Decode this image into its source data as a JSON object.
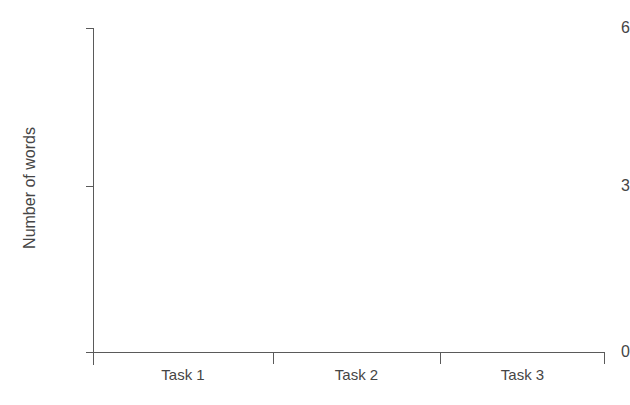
{
  "chart_data": {
    "type": "bar",
    "title": "",
    "subtitle": "",
    "xlabel": "",
    "ylabel": "Number of words",
    "categories": [
      "Task 1",
      "Task 2",
      "Task 3"
    ],
    "values": [
      0,
      0,
      0
    ],
    "series": [],
    "ylim": [
      0,
      6
    ],
    "y_ticks": [
      "0",
      "3",
      "6"
    ],
    "y_tick_values": [
      0,
      3,
      6
    ],
    "grid": false,
    "legend": false,
    "legend_position": "none",
    "annotations": [],
    "note": "Empty plot frame: axes and labels are drawn but no data series is rendered in the plot area."
  },
  "axes": {
    "y": {
      "label": "Number of words",
      "ticks": [
        {
          "label": "6",
          "value": 6
        },
        {
          "label": "3",
          "value": 3
        },
        {
          "label": "0",
          "value": 0
        }
      ]
    },
    "x": {
      "label": "",
      "categories": [
        {
          "label": "Task 1"
        },
        {
          "label": "Task 2"
        },
        {
          "label": "Task 3"
        }
      ]
    }
  },
  "style": {
    "background": "#ffffff",
    "axis_color": "#5a5a5a",
    "text_color": "#454545"
  }
}
